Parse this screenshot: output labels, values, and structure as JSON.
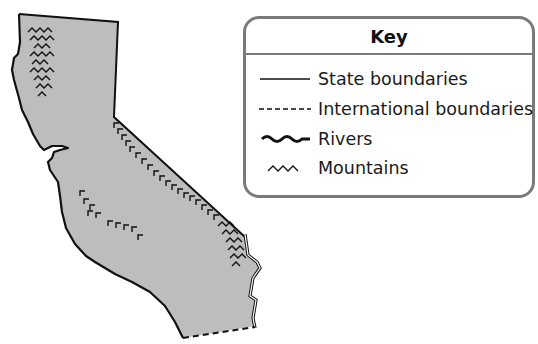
{
  "map": {
    "title": "California physical map",
    "colors": {
      "land": "#bdbdbd",
      "outline": "#111111",
      "water": "#ffffff",
      "key_border": "#7a7a7a"
    }
  },
  "key": {
    "title": "Key",
    "items": [
      {
        "symbol": "solid-line",
        "label": "State boundaries"
      },
      {
        "symbol": "dashed-line",
        "label": "International boundaries"
      },
      {
        "symbol": "wavy-line",
        "label": "Rivers"
      },
      {
        "symbol": "mountain-marks",
        "label": "Mountains"
      }
    ]
  }
}
